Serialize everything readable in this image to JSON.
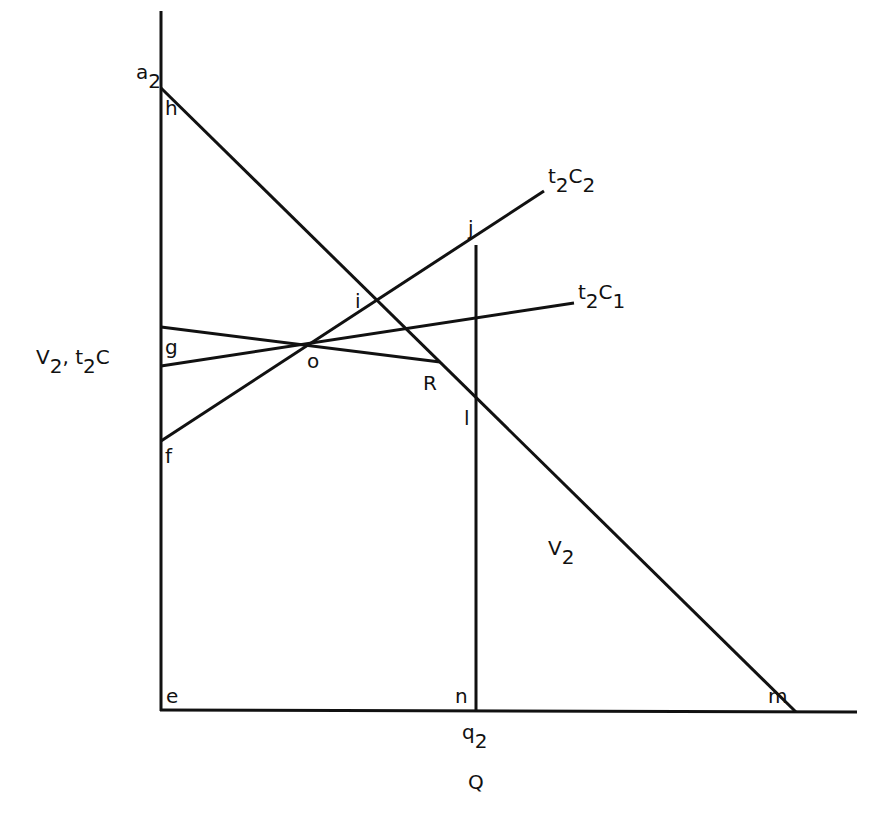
{
  "diagram": {
    "axes": {
      "x_label": "Q",
      "y_label_main": "V",
      "y_label_sub": "2",
      "y_label_sep": ",",
      "y_label_t": "t",
      "y_label_t_sub": "2",
      "y_label_c": "C",
      "origin_label": "e"
    },
    "curves": {
      "v2": {
        "label_main": "V",
        "label_sub": "2"
      },
      "t2c2": {
        "label_t": "t",
        "label_t_sub": "2",
        "label_c": "C",
        "label_c_sub": "2"
      },
      "t2c1": {
        "label_t": "t",
        "label_t_sub": "2",
        "label_c": "C",
        "label_c_sub": "1"
      }
    },
    "points": {
      "a2_main": "a",
      "a2_sub": "2",
      "h": "h",
      "g": "g",
      "f": "f",
      "o": "o",
      "i": "i",
      "j": "j",
      "R": "R",
      "l": "l",
      "n": "n",
      "m": "m",
      "q2_main": "q",
      "q2_sub": "2"
    },
    "colors": {
      "line": "#111111",
      "background": "#ffffff"
    }
  }
}
